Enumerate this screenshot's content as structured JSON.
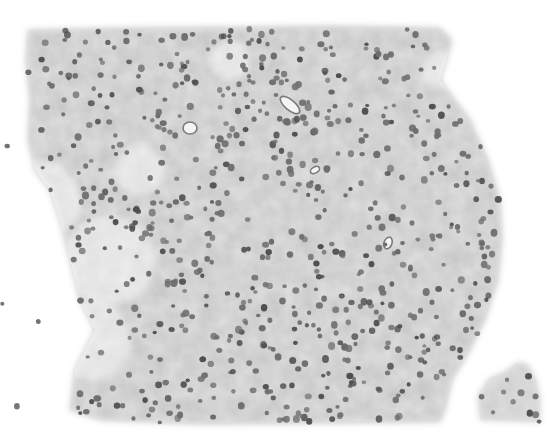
{
  "image": {
    "kind": "grayscale histology micrograph",
    "description": "Section of densely cellular tissue with many round dark nuclei on a mottled gray background; ragged left border with scattered cells, rounded right border, small detached fragment at bottom right.",
    "width": 554,
    "height": 436,
    "colors": {
      "background": "#ffffff",
      "tissue_light": "#d9d9d9",
      "tissue_mid": "#bdbdbd",
      "tissue_dark": "#a8a8a8",
      "nucleus": "#6e6e6e",
      "nucleus_dark": "#505050"
    },
    "tissue_outline": [
      [
        28,
        30
      ],
      [
        120,
        28
      ],
      [
        250,
        27
      ],
      [
        330,
        26
      ],
      [
        440,
        28
      ],
      [
        452,
        40
      ],
      [
        440,
        80
      ],
      [
        470,
        120
      ],
      [
        488,
        160
      ],
      [
        500,
        200
      ],
      [
        502,
        240
      ],
      [
        498,
        280
      ],
      [
        485,
        320
      ],
      [
        470,
        350
      ],
      [
        452,
        380
      ],
      [
        445,
        410
      ],
      [
        440,
        422
      ],
      [
        200,
        424
      ],
      [
        100,
        420
      ],
      [
        70,
        410
      ],
      [
        75,
        370
      ],
      [
        95,
        330
      ],
      [
        80,
        300
      ],
      [
        70,
        260
      ],
      [
        60,
        220
      ],
      [
        50,
        190
      ],
      [
        35,
        170
      ],
      [
        28,
        140
      ],
      [
        30,
        100
      ],
      [
        26,
        60
      ]
    ],
    "fragment_outline": [
      [
        480,
        420
      ],
      [
        478,
        395
      ],
      [
        490,
        378
      ],
      [
        505,
        372
      ],
      [
        518,
        362
      ],
      [
        528,
        365
      ],
      [
        536,
        380
      ],
      [
        540,
        400
      ],
      [
        540,
        422
      ]
    ],
    "light_regions": [
      {
        "cx": 40,
        "cy": 200,
        "r": 40
      },
      {
        "cx": 110,
        "cy": 260,
        "r": 45
      },
      {
        "cx": 90,
        "cy": 340,
        "r": 40
      },
      {
        "cx": 140,
        "cy": 170,
        "r": 25
      },
      {
        "cx": 230,
        "cy": 60,
        "r": 20
      },
      {
        "cx": 440,
        "cy": 70,
        "r": 18
      }
    ],
    "vessels": [
      {
        "cx": 290,
        "cy": 105,
        "rx": 12,
        "ry": 5,
        "rot": 40
      },
      {
        "cx": 190,
        "cy": 128,
        "rx": 7,
        "ry": 6,
        "rot": 0
      },
      {
        "cx": 315,
        "cy": 170,
        "rx": 5,
        "ry": 3,
        "rot": -30
      },
      {
        "cx": 388,
        "cy": 243,
        "rx": 4,
        "ry": 6,
        "rot": 20
      }
    ],
    "nucleus_seed": 1337,
    "nucleus_count": 720
  }
}
